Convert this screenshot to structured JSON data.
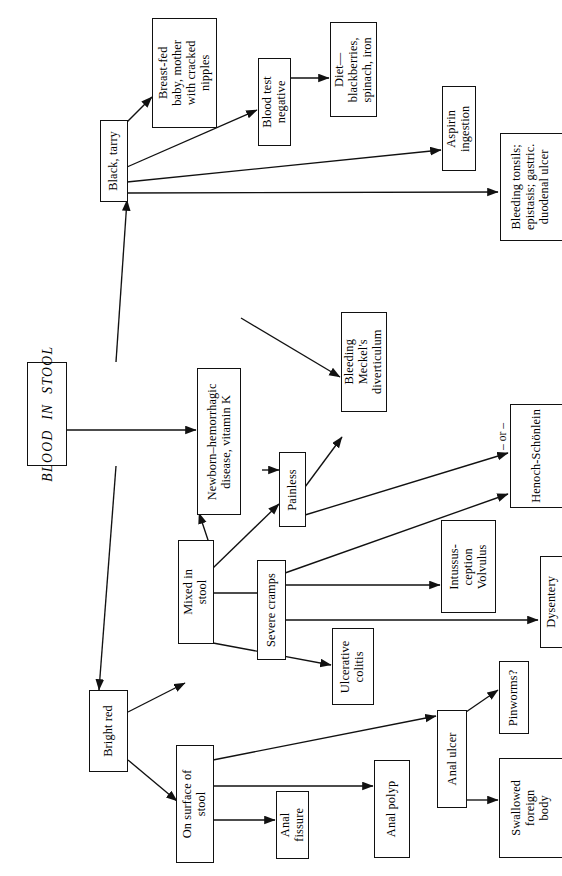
{
  "diagram": {
    "title": "BLOOD IN STOOL",
    "orientation": "rotated-90-ccw",
    "type": "clinical decision flowchart"
  },
  "nodes": {
    "root": {
      "label": "BLOOD  IN  STOOL"
    },
    "black_tarry": {
      "label": "Black, tarry"
    },
    "breast_fed": {
      "label": "Breast-fed\nbaby, mother\nwith cracked\nnipples"
    },
    "blood_test_neg": {
      "label": "Blood test\nnegative"
    },
    "diet": {
      "label": "Diet—\nblackberries,\nspinach, iron"
    },
    "aspirin": {
      "label": "Aspirin\ningestion"
    },
    "bleeding_tonsils": {
      "label": "Bleeding tonsils;\nepistasis; gastric.\nduodenal ulcer"
    },
    "newborn": {
      "label": "Newborn–hemorrhagic\ndisease, vitamin K"
    },
    "bright_red": {
      "label": "Bright red"
    },
    "mixed_in_stool": {
      "label": "Mixed in\nstool"
    },
    "painless": {
      "label": "Painless"
    },
    "severe_cramps": {
      "label": "Severe cramps"
    },
    "ulcerative": {
      "label": "Ulcerative\ncolitis"
    },
    "meckel": {
      "label": "Bleeding\nMeckel's\ndiverticulum"
    },
    "henoch": {
      "label": "Henoch-Schönlein"
    },
    "intussusception": {
      "label": "Intussus-\nception\nVolvulus"
    },
    "dysentery": {
      "label": "Dysentery"
    },
    "on_surface": {
      "label": "On surface of\nstool"
    },
    "anal_fissure": {
      "label": "Anal\nfissure"
    },
    "anal_polyp": {
      "label": "Anal polyp"
    },
    "anal_ulcer": {
      "label": "Anal ulcer"
    },
    "pinworms": {
      "label": "Pinworms?"
    },
    "swallowed": {
      "label": "Swallowed\nforeign\nbody"
    }
  },
  "labels": {
    "or_connector": "– or –"
  },
  "colors": {
    "stroke": "#111111",
    "background": "#ffffff",
    "text": "#000000"
  }
}
